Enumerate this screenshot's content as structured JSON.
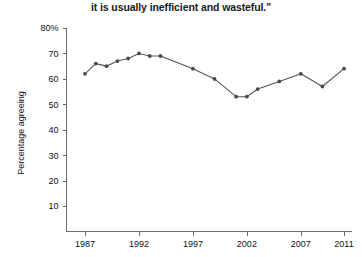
{
  "chart_data": {
    "type": "line",
    "title": "it is usually inefficient and wasteful.\"",
    "xlabel": "",
    "ylabel": "Percentage agreeing",
    "xlim": [
      1986,
      2012
    ],
    "ylim": [
      0,
      80
    ],
    "grid": false,
    "legend": "none",
    "y_ticks": [
      "80%",
      "70",
      "60",
      "50",
      "40",
      "30",
      "20",
      "10"
    ],
    "y_tick_values": [
      80,
      70,
      60,
      50,
      40,
      30,
      20,
      10
    ],
    "x_ticks": [
      "1987",
      "1992",
      "1997",
      "2002",
      "2007",
      "2011"
    ],
    "x_tick_values": [
      1987,
      1992,
      1997,
      2002,
      2007,
      2011
    ],
    "series": [
      {
        "name": "Percentage agreeing",
        "color": "#555555",
        "x": [
          1987,
          1988,
          1989,
          1990,
          1991,
          1992,
          1993,
          1994,
          1997,
          1999,
          2001,
          2002,
          2003,
          2005,
          2007,
          2009,
          2011
        ],
        "values": [
          62,
          66,
          65,
          67,
          68,
          70,
          69,
          69,
          64,
          60,
          53,
          53,
          56,
          59,
          62,
          57,
          64
        ]
      }
    ]
  }
}
